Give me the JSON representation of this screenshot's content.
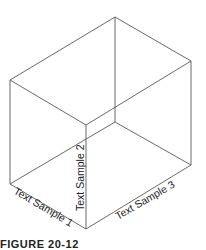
{
  "diagram": {
    "type": "isometric-box",
    "labels": {
      "left": "Text Sample 1",
      "front": "Text Sample 2",
      "right": "Text Sample 3"
    },
    "caption": "FIGURE 20-12",
    "line_color": "#444444"
  }
}
